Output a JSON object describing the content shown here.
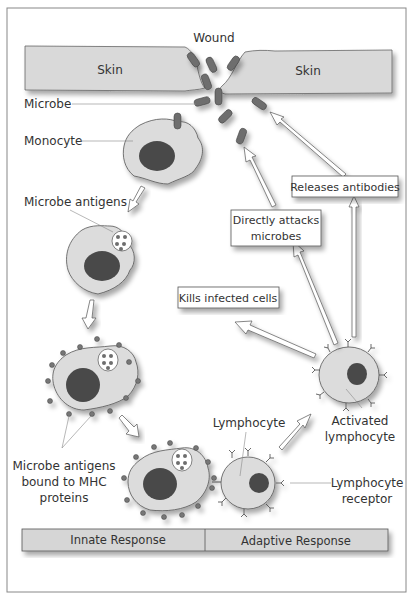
{
  "diagram": {
    "labels": {
      "wound": "Wound",
      "skin_left": "Skin",
      "skin_right": "Skin",
      "microbe": "Microbe",
      "monocyte": "Monocyte",
      "microbe_antigens": "Microbe antigens",
      "mhc_line1": "Microbe antigens",
      "mhc_line2": "bound to MHC",
      "mhc_line3": "proteins",
      "lymphocyte": "Lymphocyte",
      "activated_line1": "Activated",
      "activated_line2": "lymphocyte",
      "receptor_line1": "Lymphocyte",
      "receptor_line2": "receptor"
    },
    "action_boxes": {
      "releases_antibodies": "Releases antibodies",
      "directly_attacks_line1": "Directly attacks",
      "directly_attacks_line2": "microbes",
      "kills_infected": "Kills infected cells"
    },
    "footer": {
      "innate": "Innate Response",
      "adaptive": "Adaptive Response"
    },
    "colors": {
      "skin": "#d9d9d9",
      "cell": "#dcdcdc",
      "nucleus": "#4a4a4a",
      "microbe": "#6e6e6e",
      "footer_bg": "#d6d6d6",
      "border": "#555555"
    }
  }
}
